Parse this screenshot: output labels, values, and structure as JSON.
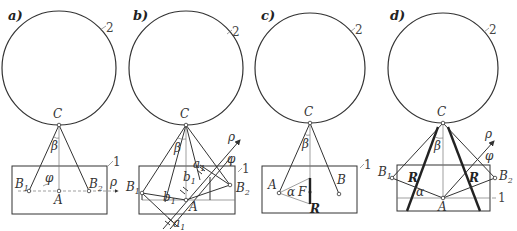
{
  "figure": {
    "panels": [
      {
        "id": "a",
        "title": "a)",
        "labels": {
          "circle_num": "2",
          "rect_num": "1",
          "C": "C",
          "beta": "β",
          "B1": "B",
          "B1_sub": "1",
          "B2": "B",
          "B2_sub": "2",
          "phi": "φ",
          "A": "A",
          "rho": "ρ"
        }
      },
      {
        "id": "b",
        "title": "b)",
        "labels": {
          "circle_num": "2",
          "rect_num": "1",
          "C": "C",
          "beta": "β",
          "B1": "B",
          "B1_sub": "1",
          "B2": "B",
          "B2_sub": "2",
          "phi": "φ",
          "A": "A",
          "rho": "ρ",
          "a1_top": "a",
          "a1_top_sub": "1",
          "b1_top": "b",
          "b1_top_sub": "1",
          "b1_bottom": "b",
          "b1_bottom_sub": "1",
          "a1_bottom": "a",
          "a1_bottom_sub": "1"
        }
      },
      {
        "id": "c",
        "title": "c)",
        "labels": {
          "circle_num": "2",
          "rect_num": "1",
          "C": "C",
          "beta": "β",
          "A": "A",
          "B": "B",
          "alpha": "α",
          "F": "F",
          "R": "R"
        }
      },
      {
        "id": "d",
        "title": "d)",
        "labels": {
          "circle_num": "2",
          "rect_num": "1",
          "C": "C",
          "beta": "β",
          "B1": "B",
          "B1_sub": "1",
          "B2": "B",
          "B2_sub": "2",
          "phi": "φ",
          "A": "A",
          "rho": "ρ",
          "R_left": "R",
          "R_right": "R",
          "alpha": "α"
        }
      }
    ]
  }
}
